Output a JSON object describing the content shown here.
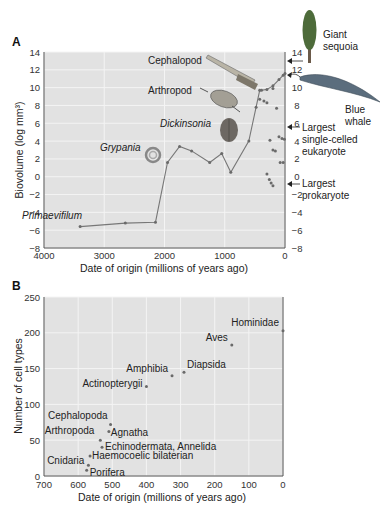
{
  "chart_data": [
    {
      "panel": "A",
      "type": "line",
      "title": "",
      "xlabel": "Date of origin (millions of years ago)",
      "ylabel": "Biovolume (log mm³)",
      "xlim": [
        4000,
        0
      ],
      "ylim": [
        -8,
        14
      ],
      "xticks": [
        "4000",
        "3000",
        "2000",
        "1000",
        "0"
      ],
      "yticks": [
        "14",
        "12",
        "10",
        "8",
        "6",
        "4",
        "2",
        "0",
        "-2",
        "-4",
        "-6",
        "-8"
      ],
      "right_yticks": [
        "14",
        "12",
        "10",
        "8",
        "6",
        "4",
        "2",
        "0",
        "-2",
        "-4",
        "-6",
        "-8"
      ],
      "grid": true,
      "series": [
        {
          "name": "Maximum biovolume",
          "x": [
            3400,
            2650,
            2150,
            1950,
            1750,
            1550,
            1250,
            1050,
            900,
            600,
            480,
            420,
            390,
            300,
            200,
            100,
            30,
            0
          ],
          "y": [
            -5.6,
            -5.2,
            -5.1,
            1.6,
            3.4,
            2.9,
            1.6,
            2.6,
            0.5,
            4.0,
            7.8,
            9.7,
            9.7,
            9.8,
            10.2,
            10.9,
            11.4,
            11.6
          ]
        },
        {
          "name": "Other taxa",
          "type": "scatter",
          "x": [
            420,
            350,
            300,
            200,
            140,
            100,
            50,
            10,
            250,
            200,
            160,
            80,
            30,
            300,
            260,
            230,
            200
          ],
          "y": [
            8.7,
            8.5,
            8.3,
            9.9,
            7.7,
            4.5,
            4.3,
            4.2,
            4.1,
            3.0,
            2.9,
            1.6,
            1.6,
            0.3,
            -0.3,
            -0.7,
            -1.0
          ]
        }
      ],
      "annotations": [
        {
          "label": "Primaevifilum",
          "italic": true
        },
        {
          "label": "Grypania",
          "italic": true
        },
        {
          "label": "Dickinsonia",
          "italic": true
        },
        {
          "label": "Arthropod",
          "italic": false
        },
        {
          "label": "Cephalopod",
          "italic": false
        },
        {
          "label": "Giant sequoia",
          "y": 13.5
        },
        {
          "label": "Blue whale",
          "y": 12.0
        },
        {
          "label": "Largest single-celled eukaryote",
          "y": 5.8
        },
        {
          "label": "Largest prokaryote",
          "y": -1.0
        }
      ]
    },
    {
      "panel": "B",
      "type": "scatter",
      "title": "",
      "xlabel": "Date of origin (millions of years ago)",
      "ylabel": "Number of cell types",
      "xlim": [
        700,
        0
      ],
      "ylim": [
        0,
        250
      ],
      "xticks": [
        "700",
        "600",
        "500",
        "400",
        "300",
        "200",
        "100",
        "0"
      ],
      "yticks": [
        "250",
        "200",
        "150",
        "100",
        "50",
        "0"
      ],
      "grid": true,
      "points": [
        {
          "label": "Hominidae",
          "x": 0,
          "y": 203
        },
        {
          "label": "Aves",
          "x": 150,
          "y": 183
        },
        {
          "label": "Diapsida",
          "x": 290,
          "y": 145
        },
        {
          "label": "Amphibia",
          "x": 325,
          "y": 140
        },
        {
          "label": "Actinopterygii",
          "x": 400,
          "y": 125
        },
        {
          "label": "Cephalopoda",
          "x": 505,
          "y": 72
        },
        {
          "label": "Agnatha",
          "x": 510,
          "y": 62
        },
        {
          "label": "Arthropoda",
          "x": 535,
          "y": 50
        },
        {
          "label": "Echinodermata, Annelida",
          "x": 530,
          "y": 40
        },
        {
          "label": "Haemocoelic bilaterian",
          "x": 565,
          "y": 28
        },
        {
          "label": "Cnidaria",
          "x": 570,
          "y": 15
        },
        {
          "label": "Porifera",
          "x": 575,
          "y": 8
        }
      ]
    }
  ],
  "panels": {
    "a_label": "A",
    "b_label": "B"
  },
  "colors": {
    "plot_bg": "#e2e2e2",
    "grid": "#f4f4f4",
    "line": "#777777",
    "marker": "#6a6a6a",
    "axis": "#444444"
  }
}
